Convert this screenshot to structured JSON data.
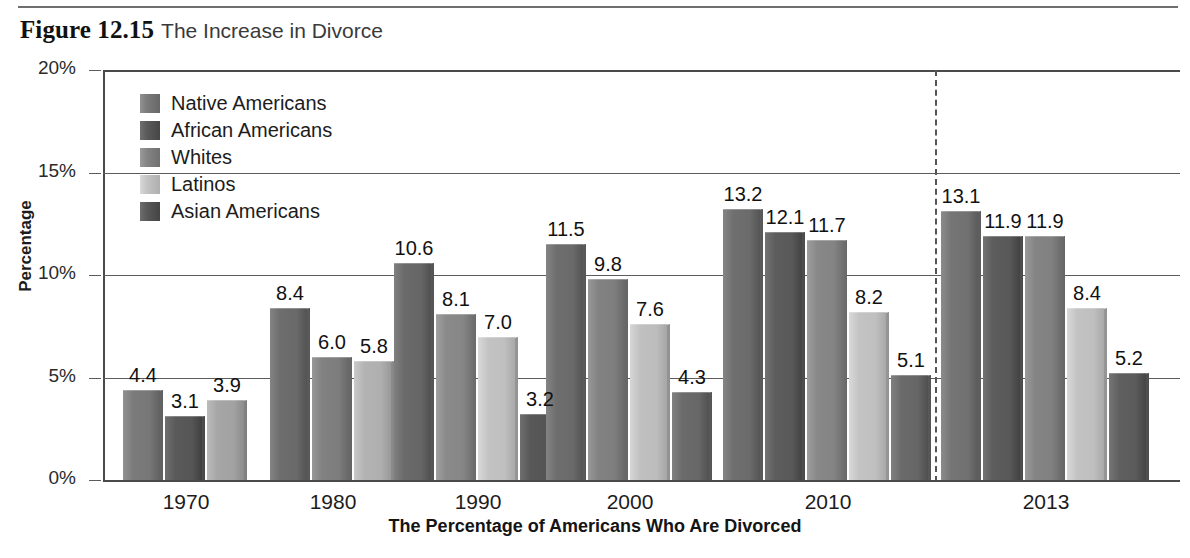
{
  "figure": {
    "label": "Figure 12.15",
    "caption": "The Increase in Divorce"
  },
  "chart_data": {
    "type": "bar",
    "title": "The Increase in Divorce",
    "xlabel": "The Percentage of Americans Who Are Divorced",
    "ylabel": "Percentage",
    "ylim": [
      0,
      20
    ],
    "yticks": [
      "0%",
      "5%",
      "10%",
      "15%",
      "20%"
    ],
    "ytick_values": [
      0,
      5,
      10,
      15,
      20
    ],
    "grid": true,
    "legend_position": "upper-left-inside",
    "categories": [
      "1970",
      "1980",
      "1990",
      "2000",
      "2010",
      "2013"
    ],
    "series": [
      {
        "name": "Native Americans",
        "color": "#7b7b7b",
        "values": [
          4.4,
          8.4,
          10.6,
          11.5,
          13.2,
          13.1
        ]
      },
      {
        "name": "African Americans",
        "color": "#5a5a5a",
        "values": [
          3.1,
          6.0,
          null,
          9.8,
          12.1,
          11.9
        ]
      },
      {
        "name": "Whites",
        "color": "#848484",
        "values": [
          3.9,
          5.8,
          8.1,
          7.6,
          11.7,
          11.9
        ]
      },
      {
        "name": "Latinos",
        "color": "#c3c3c3",
        "values": [
          null,
          null,
          7.0,
          7.6,
          8.2,
          8.4
        ]
      },
      {
        "name": "Asian Americans",
        "color": "#585858",
        "values": [
          null,
          null,
          3.2,
          4.3,
          5.1,
          5.2
        ]
      }
    ],
    "annotations": {
      "divider": "dashed vertical line between 2010 and 2013"
    },
    "bar_groups": [
      {
        "year": "1970",
        "bars": [
          {
            "series": "Native Americans",
            "value": 4.4,
            "label": "4.4",
            "color": "#7b7b7b"
          },
          {
            "series": "African Americans",
            "value": 3.1,
            "label": "3.1",
            "color": "#5a5a5a"
          },
          {
            "series": "Whites",
            "value": 3.9,
            "label": "3.9",
            "color": "#a6a6a6"
          }
        ]
      },
      {
        "year": "1980",
        "bars": [
          {
            "series": "Native Americans",
            "value": 8.4,
            "label": "8.4",
            "color": "#6d6d6d"
          },
          {
            "series": "African Americans",
            "value": 6.0,
            "label": "6.0",
            "color": "#818181"
          },
          {
            "series": "Whites",
            "value": 5.8,
            "label": "5.8",
            "color": "#b3b3b3"
          }
        ]
      },
      {
        "year": "1990",
        "bars": [
          {
            "series": "Native Americans",
            "value": 10.6,
            "label": "10.6",
            "color": "#6a6a6a"
          },
          {
            "series": "Whites",
            "value": 8.1,
            "label": "8.1",
            "color": "#8a8a8a"
          },
          {
            "series": "Latinos",
            "value": 7.0,
            "label": "7.0",
            "color": "#c3c3c3"
          },
          {
            "series": "Asian Americans",
            "value": 3.2,
            "label": "3.2",
            "color": "#585858"
          }
        ]
      },
      {
        "year": "2000",
        "bars": [
          {
            "series": "Native Americans",
            "value": 11.5,
            "label": "11.5",
            "color": "#6e6e6e"
          },
          {
            "series": "African Americans",
            "value": 9.8,
            "label": "9.8",
            "color": "#828282"
          },
          {
            "series": "Latinos",
            "value": 7.6,
            "label": "7.6",
            "color": "#c0c0c0"
          },
          {
            "series": "Asian Americans",
            "value": 4.3,
            "label": "4.3",
            "color": "#6b6b6b"
          }
        ]
      },
      {
        "year": "2010",
        "bars": [
          {
            "series": "Native Americans",
            "value": 13.2,
            "label": "13.2",
            "color": "#6f6f6f"
          },
          {
            "series": "African Americans",
            "value": 12.1,
            "label": "12.1",
            "color": "#5d5d5d"
          },
          {
            "series": "Whites",
            "value": 11.7,
            "label": "11.7",
            "color": "#888888"
          },
          {
            "series": "Latinos",
            "value": 8.2,
            "label": "8.2",
            "color": "#c3c3c3"
          },
          {
            "series": "Asian Americans",
            "value": 5.1,
            "label": "5.1",
            "color": "#6a6a6a"
          }
        ]
      },
      {
        "year": "2013",
        "bars": [
          {
            "series": "Native Americans",
            "value": 13.1,
            "label": "13.1",
            "color": "#757575"
          },
          {
            "series": "African Americans",
            "value": 11.9,
            "label": "11.9",
            "color": "#5c5c5c"
          },
          {
            "series": "Whites",
            "value": 11.9,
            "label": "11.9",
            "color": "#848484"
          },
          {
            "series": "Latinos",
            "value": 8.4,
            "label": "8.4",
            "color": "#c3c3c3"
          },
          {
            "series": "Asian Americans",
            "value": 5.2,
            "label": "5.2",
            "color": "#5f5f5f"
          }
        ]
      }
    ]
  }
}
